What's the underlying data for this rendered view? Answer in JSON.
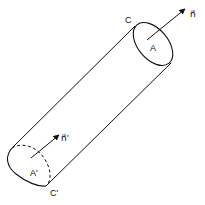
{
  "diagram": {
    "type": "flux-tube / cylinder with end-cap normals",
    "stroke_color": "#111111",
    "background": "#ffffff",
    "labels": {
      "top_area": "A",
      "top_edge": "C",
      "top_normal": "n⃗",
      "bottom_area": "A'",
      "bottom_edge": "C'",
      "bottom_normal": "n⃗'"
    }
  }
}
